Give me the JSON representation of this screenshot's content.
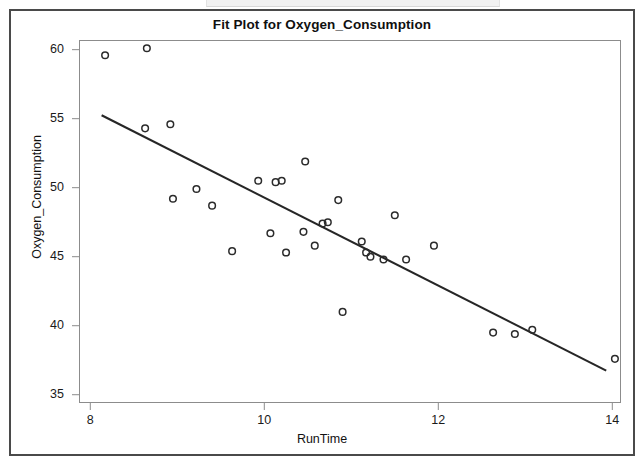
{
  "chart_data": {
    "type": "scatter",
    "title": "Fit Plot for Oxygen_Consumption",
    "xlabel": "RunTime",
    "ylabel": "Oxygen_Consumption",
    "xlim": [
      7.87,
      14.1
    ],
    "ylim": [
      34.4,
      60.7
    ],
    "xticks": [
      8,
      10,
      12,
      14
    ],
    "yticks": [
      35,
      40,
      45,
      50,
      55,
      60
    ],
    "grid": false,
    "legend": null,
    "marker": "open-circle",
    "marker_color": "#2b2b2b",
    "line_color": "#262626",
    "points": [
      {
        "x": 8.17,
        "y": 59.6
      },
      {
        "x": 8.65,
        "y": 60.1
      },
      {
        "x": 8.63,
        "y": 54.3
      },
      {
        "x": 8.92,
        "y": 54.6
      },
      {
        "x": 8.95,
        "y": 49.2
      },
      {
        "x": 9.22,
        "y": 49.9
      },
      {
        "x": 9.4,
        "y": 48.7
      },
      {
        "x": 9.63,
        "y": 45.4
      },
      {
        "x": 9.93,
        "y": 50.5
      },
      {
        "x": 10.07,
        "y": 46.7
      },
      {
        "x": 10.13,
        "y": 50.4
      },
      {
        "x": 10.2,
        "y": 50.5
      },
      {
        "x": 10.25,
        "y": 45.3
      },
      {
        "x": 10.47,
        "y": 51.9
      },
      {
        "x": 10.45,
        "y": 46.8
      },
      {
        "x": 10.58,
        "y": 45.8
      },
      {
        "x": 10.67,
        "y": 47.4
      },
      {
        "x": 10.73,
        "y": 47.5
      },
      {
        "x": 10.85,
        "y": 49.1
      },
      {
        "x": 10.9,
        "y": 41.0
      },
      {
        "x": 11.12,
        "y": 46.1
      },
      {
        "x": 11.17,
        "y": 45.3
      },
      {
        "x": 11.22,
        "y": 45.0
      },
      {
        "x": 11.37,
        "y": 44.8
      },
      {
        "x": 11.5,
        "y": 48.0
      },
      {
        "x": 11.63,
        "y": 44.8
      },
      {
        "x": 11.95,
        "y": 45.8
      },
      {
        "x": 12.63,
        "y": 39.5
      },
      {
        "x": 12.88,
        "y": 39.4
      },
      {
        "x": 13.08,
        "y": 39.7
      },
      {
        "x": 14.03,
        "y": 37.6
      }
    ],
    "fit_line": {
      "x_start": 8.13,
      "y_start": 55.25,
      "x_end": 13.93,
      "y_end": 36.75
    }
  },
  "axis": {
    "y_tick_labels": [
      "60",
      "55",
      "50",
      "45",
      "40",
      "35"
    ],
    "x_tick_labels": [
      "8",
      "10",
      "12",
      "14"
    ]
  }
}
